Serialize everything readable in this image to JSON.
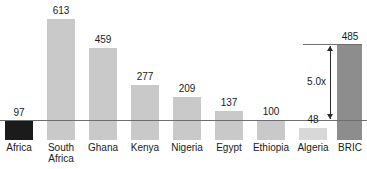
{
  "chart_data": {
    "type": "bar",
    "title": "",
    "subtitle": "",
    "xlabel": "",
    "ylabel": "",
    "categories": [
      "Africa",
      "South Africa",
      "Ghana",
      "Kenya",
      "Nigeria",
      "Egypt",
      "Ethiopia",
      "Algeria",
      "BRIC"
    ],
    "values": [
      97,
      613,
      459,
      277,
      209,
      137,
      100,
      48,
      485
    ],
    "value_labels": [
      "97",
      "613",
      "459",
      "277",
      "209",
      "137",
      "100",
      "48",
      "485"
    ],
    "baseline_value": 100,
    "ylim": [
      0,
      700
    ],
    "grid": false,
    "legend": null,
    "annotations": [
      {
        "name": "multiple-annotation",
        "text": "5.0x"
      }
    ]
  },
  "bars": [
    {
      "name": "africa",
      "label_line1": "Africa",
      "label_line2": "",
      "value_label": "97",
      "x": 5,
      "width": 28,
      "top": 121,
      "bottom": 140,
      "color": "#1b1b1b",
      "label_x": 0,
      "label_width": 38,
      "value_x": 0,
      "value_width": 38,
      "value_y": 107
    },
    {
      "name": "south-africa",
      "label_line1": "South",
      "label_line2": "Africa",
      "value_label": "613",
      "x": 47,
      "width": 28,
      "top": 19,
      "bottom": 140,
      "color": "#c9c9c9",
      "label_x": 42,
      "label_width": 38,
      "value_x": 42,
      "value_width": 38,
      "value_y": 5
    },
    {
      "name": "ghana",
      "label_line1": "Ghana",
      "label_line2": "",
      "value_label": "459",
      "x": 89,
      "width": 28,
      "top": 48,
      "bottom": 140,
      "color": "#c9c9c9",
      "label_x": 84,
      "label_width": 38,
      "value_x": 84,
      "value_width": 38,
      "value_y": 34
    },
    {
      "name": "kenya",
      "label_line1": "Kenya",
      "label_line2": "",
      "value_label": "277",
      "x": 131,
      "width": 28,
      "top": 85,
      "bottom": 140,
      "color": "#c9c9c9",
      "label_x": 126,
      "label_width": 38,
      "value_x": 126,
      "value_width": 38,
      "value_y": 71
    },
    {
      "name": "nigeria",
      "label_line1": "Nigeria",
      "label_line2": "",
      "value_label": "209",
      "x": 173,
      "width": 28,
      "top": 97,
      "bottom": 140,
      "color": "#c9c9c9",
      "label_x": 167,
      "label_width": 40,
      "value_x": 167,
      "value_width": 40,
      "value_y": 83
    },
    {
      "name": "egypt",
      "label_line1": "Egypt",
      "label_line2": "",
      "value_label": "137",
      "x": 215,
      "width": 28,
      "top": 111,
      "bottom": 140,
      "color": "#c9c9c9",
      "label_x": 210,
      "label_width": 38,
      "value_x": 210,
      "value_width": 38,
      "value_y": 97
    },
    {
      "name": "ethiopia",
      "label_line1": "Ethiopia",
      "label_line2": "",
      "value_label": "100",
      "x": 257,
      "width": 28,
      "top": 120,
      "bottom": 140,
      "color": "#c9c9c9",
      "label_x": 249,
      "label_width": 44,
      "value_x": 250,
      "value_width": 42,
      "value_y": 106
    },
    {
      "name": "algeria",
      "label_line1": "Algeria",
      "label_line2": "",
      "value_label": "48",
      "x": 299,
      "width": 28,
      "top": 128,
      "bottom": 140,
      "color": "#d8d8d8",
      "label_x": 293,
      "label_width": 40,
      "value_x": 293,
      "value_width": 40,
      "value_y": 114
    },
    {
      "name": "bric",
      "label_line1": "BRIC",
      "label_line2": "",
      "value_label": "485",
      "x": 337,
      "width": 25,
      "top": 45,
      "bottom": 140,
      "color": "#8d8d8d",
      "label_x": 331,
      "label_width": 38,
      "value_x": 331,
      "value_width": 38,
      "value_y": 31
    }
  ],
  "annotation": {
    "multiple_text": "5.0x"
  }
}
